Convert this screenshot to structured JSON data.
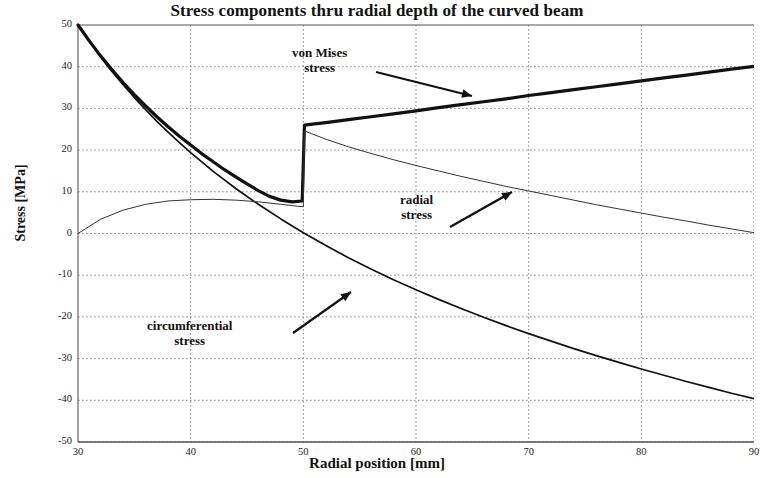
{
  "chart_data": {
    "type": "line",
    "title": "Stress components thru radial depth of the curved beam",
    "xlabel": "Radial position [mm]",
    "ylabel": "Stress [MPa]",
    "xlim": [
      30,
      90
    ],
    "ylim": [
      -50,
      50
    ],
    "xticks": [
      30,
      40,
      50,
      60,
      70,
      80,
      90
    ],
    "yticks": [
      50,
      40,
      30,
      20,
      10,
      0,
      -10,
      -20,
      -30,
      -40,
      -50
    ],
    "grid": true,
    "legend": "annotations",
    "annotations": [
      {
        "text_line1": "von Mises",
        "text_line2": "stress",
        "points_to_series": "von Mises stress",
        "target_x": 70,
        "target_y": 33
      },
      {
        "text_line1": "radial",
        "text_line2": "stress",
        "points_to_series": "radial stress",
        "target_x": 70,
        "target_y": 11
      },
      {
        "text_line1": "circumferential",
        "text_line2": "stress",
        "points_to_series": "circumferential stress",
        "target_x": 58,
        "target_y": -15
      }
    ],
    "series": [
      {
        "name": "von Mises stress",
        "line_width": "thick",
        "color": "#111111",
        "note": "discontinuous jump at r = 50 mm",
        "x": [
          30,
          31,
          32,
          33,
          34,
          35,
          36,
          37,
          38,
          39,
          40,
          41,
          42,
          43,
          44,
          45,
          46,
          47,
          48,
          49,
          49.9,
          50.1,
          51,
          52,
          54,
          56,
          58,
          60,
          62,
          64,
          66,
          68,
          70,
          72,
          74,
          76,
          78,
          80,
          82,
          84,
          86,
          88,
          90
        ],
        "y": [
          50,
          46.2,
          42.6,
          39.3,
          36.2,
          33.3,
          30.6,
          28.0,
          25.6,
          23.3,
          21.2,
          19.1,
          17.2,
          15.3,
          13.6,
          11.9,
          10.3,
          8.9,
          8.0,
          7.6,
          7.8,
          26.0,
          26.3,
          26.6,
          27.3,
          28.0,
          28.7,
          29.4,
          30.2,
          30.9,
          31.6,
          32.3,
          33.1,
          33.8,
          34.5,
          35.2,
          35.9,
          36.6,
          37.3,
          38.0,
          38.7,
          39.4,
          40.1
        ]
      },
      {
        "name": "circumferential stress",
        "line_width": "medium",
        "color": "#111111",
        "x": [
          30,
          31,
          32,
          33,
          34,
          35,
          36,
          37,
          38,
          39,
          40,
          42,
          44,
          46,
          48,
          50,
          52,
          54,
          56,
          58,
          60,
          62,
          64,
          66,
          68,
          70,
          72,
          74,
          76,
          78,
          80,
          82,
          84,
          86,
          88,
          90
        ],
        "y": [
          50,
          46.1,
          42.4,
          38.9,
          35.7,
          32.6,
          29.7,
          26.9,
          24.3,
          21.8,
          19.4,
          14.9,
          10.8,
          7.0,
          3.5,
          0.2,
          -2.9,
          -5.8,
          -8.5,
          -11.1,
          -13.5,
          -15.8,
          -18.0,
          -20.1,
          -22.1,
          -24.0,
          -25.8,
          -27.6,
          -29.3,
          -30.9,
          -32.5,
          -34.0,
          -35.5,
          -36.9,
          -38.3,
          -39.6
        ]
      },
      {
        "name": "radial stress",
        "line_width": "thin",
        "color": "#333333",
        "x": [
          30,
          32,
          34,
          36,
          38,
          40,
          42,
          44,
          46,
          48,
          50,
          50.1,
          52,
          54,
          56,
          58,
          60,
          62,
          64,
          66,
          68,
          70,
          72,
          74,
          76,
          78,
          80,
          82,
          84,
          86,
          88,
          90
        ],
        "y": [
          0,
          3.4,
          5.6,
          7.0,
          7.8,
          8.1,
          8.2,
          8.0,
          7.6,
          7.0,
          6.4,
          24.6,
          22.6,
          20.8,
          19.2,
          17.7,
          16.3,
          15.0,
          13.7,
          12.5,
          11.3,
          10.2,
          9.1,
          8.0,
          6.9,
          5.9,
          4.9,
          3.9,
          3.0,
          2.0,
          1.1,
          0.2
        ]
      }
    ]
  },
  "axis": {
    "x_tick_labels": [
      "30",
      "40",
      "50",
      "60",
      "70",
      "80",
      "90"
    ],
    "y_tick_labels": [
      "50",
      "40",
      "30",
      "20",
      "10",
      "0",
      "-10",
      "-20",
      "-30",
      "-40",
      "-50"
    ]
  },
  "style": {
    "curve_color": "#111111",
    "thin_curve_color": "#333333",
    "grid_color": "#8a8a8a",
    "frame_color": "#555555",
    "background": "#ffffff"
  }
}
